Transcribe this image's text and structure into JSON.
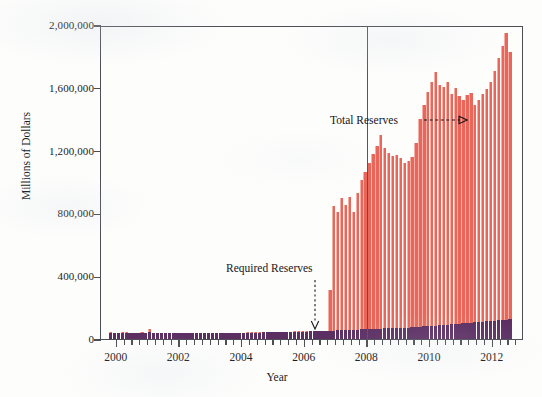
{
  "chart_data": {
    "type": "bar",
    "title": "",
    "subtitle": "",
    "xlabel": "Year",
    "ylabel": "Millions of Dollars",
    "ylim": [
      0,
      2000000
    ],
    "xlim": [
      1999.5,
      2013.0
    ],
    "ytick_labels": [
      "0",
      "400,000",
      "800,000",
      "1,200,000",
      "1,600,000",
      "2,000,000"
    ],
    "ytick_values": [
      0,
      400000,
      800000,
      1200000,
      1600000,
      2000000
    ],
    "xtick_labels": [
      "2000",
      "2002",
      "2004",
      "2006",
      "2008",
      "2010",
      "2012"
    ],
    "xtick_values": [
      2000,
      2002,
      2004,
      2006,
      2008,
      2010,
      2012
    ],
    "grid": false,
    "legend_position": "none",
    "stacked": true,
    "colors": {
      "total_reserves": "#e8675a",
      "required_reserves": "#5c2f63",
      "axis": "#4d4d55",
      "text": "#1b1b22",
      "background": "#fdfdfc"
    },
    "annotations": [
      {
        "name": "total-reserves-annotation",
        "label": "Total Reserves",
        "arrow": "dashed-right",
        "points_to_x": 2009.7,
        "points_to_y": 1400000
      },
      {
        "name": "required-reserves-annotation",
        "label": "Required Reserves",
        "arrow": "dotted-down",
        "points_to_x": 2006.4,
        "points_to_y": 60000
      },
      {
        "name": "crisis-marker-line",
        "label": "",
        "arrow": "vertical-line",
        "points_to_x": 2008.0,
        "points_to_y": 2000000
      }
    ],
    "series": [
      {
        "name": "Total Reserves",
        "color": "#e8675a",
        "values": [
          42000,
          41000,
          40500,
          41500,
          42500,
          41000,
          40000,
          41000,
          42000,
          40500,
          62000,
          41000,
          40000,
          39500,
          40000,
          39000,
          38500,
          38000,
          38500,
          39000,
          38000,
          37500,
          38000,
          38500,
          39000,
          38500,
          38000,
          39000,
          40000,
          39500,
          39000,
          40000,
          41000,
          40500,
          41000,
          42000,
          43000,
          42500,
          43000,
          44000,
          45000,
          44500,
          45000,
          46000,
          47000,
          46500,
          47000,
          48000,
          49000,
          48500,
          49000,
          50000,
          51000,
          52000,
          53000,
          54000,
          315000,
          845000,
          810000,
          900000,
          855000,
          905000,
          810000,
          930000,
          1010000,
          1065000,
          1120000,
          1180000,
          1230000,
          1300000,
          1215000,
          1185000,
          1165000,
          1175000,
          1150000,
          1120000,
          1135000,
          1160000,
          1250000,
          1400000,
          1490000,
          1575000,
          1640000,
          1700000,
          1615000,
          1605000,
          1635000,
          1560000,
          1600000,
          1545000,
          1520000,
          1555000,
          1565000,
          1490000,
          1520000,
          1560000,
          1595000,
          1640000,
          1710000,
          1790000,
          1865000,
          1950000,
          1830000
        ]
      },
      {
        "name": "Required Reserves",
        "color": "#5c2f63",
        "values": [
          39000,
          38500,
          38000,
          38500,
          39000,
          38000,
          37500,
          38000,
          38500,
          38000,
          44000,
          38500,
          38000,
          37500,
          38000,
          37000,
          36500,
          36000,
          36500,
          37000,
          36000,
          35500,
          36000,
          36500,
          37000,
          36500,
          36000,
          37000,
          38000,
          37500,
          37000,
          38000,
          39000,
          38500,
          39000,
          40000,
          41000,
          40500,
          41000,
          42000,
          43000,
          42500,
          43000,
          44000,
          45000,
          44500,
          45000,
          46000,
          47000,
          46500,
          47000,
          48000,
          49000,
          50000,
          51000,
          52000,
          53000,
          54000,
          55000,
          56000,
          57000,
          58000,
          59000,
          60000,
          61000,
          62000,
          63000,
          64000,
          65000,
          66000,
          67000,
          68000,
          69000,
          70000,
          71000,
          72000,
          73000,
          74000,
          76000,
          78000,
          80000,
          82000,
          84000,
          86000,
          88000,
          90000,
          92000,
          94000,
          96000,
          98000,
          100000,
          102000,
          104000,
          106000,
          108000,
          110000,
          112000,
          114000,
          116000,
          118000,
          120000,
          124000,
          126000
        ]
      }
    ],
    "x_start": 1999.75,
    "x_step": 0.125
  }
}
